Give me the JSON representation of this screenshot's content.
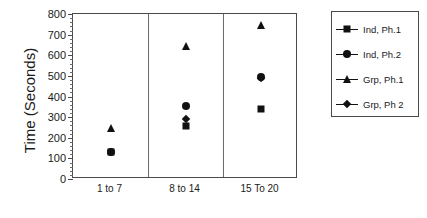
{
  "chart_data": {
    "type": "scatter",
    "title": "",
    "xlabel": "",
    "ylabel": "Time (Seconds)",
    "ylim": [
      0,
      800
    ],
    "ytick_step": 100,
    "yticks": [
      0,
      100,
      200,
      300,
      400,
      500,
      600,
      700,
      800
    ],
    "ytick_labels": [
      "0",
      "100",
      "200",
      "300",
      "400",
      "500",
      "600",
      "700",
      "800"
    ],
    "grid": false,
    "legend_position": "right-outside",
    "categories": [
      "1 to 7",
      "8 to 14",
      "15 To 20"
    ],
    "series": [
      {
        "name": "Ind, Ph.1",
        "marker": "square",
        "color": "#111111",
        "values": [
          130,
          257,
          340
        ]
      },
      {
        "name": "Ind, Ph.2",
        "marker": "circle",
        "color": "#111111",
        "values": [
          132,
          353,
          494
        ]
      },
      {
        "name": "Grp, Ph.1",
        "marker": "triangle",
        "color": "#111111",
        "values": [
          245,
          645,
          745
        ]
      },
      {
        "name": "Grp, Ph 2",
        "marker": "diamond",
        "color": "#111111",
        "values": [
          133,
          293,
          490
        ]
      }
    ]
  },
  "legend": {
    "entries": [
      {
        "label": "Ind, Ph.1",
        "marker": "square"
      },
      {
        "label": "Ind, Ph.2",
        "marker": "circle"
      },
      {
        "label": "Grp, Ph.1",
        "marker": "triangle"
      },
      {
        "label": "Grp, Ph 2",
        "marker": "diamond"
      }
    ]
  },
  "colors": {
    "marker": "#111111",
    "axis": "#4a4a4a",
    "divider": "#6b6b6b",
    "background": "#ffffff"
  }
}
